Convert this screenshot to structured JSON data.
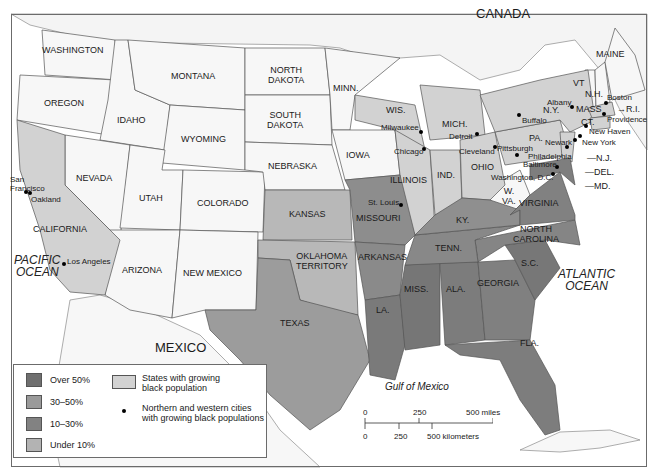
{
  "map": {
    "colors": {
      "over_50": "#6f6f6f",
      "30_50": "#9a9a9a",
      "10_30": "#828282",
      "under_10": "#b3b3b3",
      "growing_states": "#d2d2d2",
      "other_states": "#f7f7f7",
      "water": "#ffffff",
      "border": "#555555"
    },
    "regions": {
      "canada": "CANADA",
      "mexico": "MEXICO"
    },
    "oceans": {
      "pacific": [
        "PACIFIC",
        "OCEAN"
      ],
      "atlantic": [
        "ATLANTIC",
        "OCEAN"
      ],
      "gulf": "Gulf of Mexico"
    },
    "states": [
      {
        "id": "washington",
        "label": "WASHINGTON",
        "category": "none"
      },
      {
        "id": "oregon",
        "label": "OREGON",
        "category": "none"
      },
      {
        "id": "california",
        "label": "CALIFORNIA",
        "category": "growing"
      },
      {
        "id": "idaho",
        "label": "IDAHO",
        "category": "none"
      },
      {
        "id": "nevada",
        "label": "NEVADA",
        "category": "none"
      },
      {
        "id": "montana",
        "label": "MONTANA",
        "category": "none"
      },
      {
        "id": "wyoming",
        "label": "WYOMING",
        "category": "none"
      },
      {
        "id": "utah",
        "label": "UTAH",
        "category": "none"
      },
      {
        "id": "colorado",
        "label": "COLORADO",
        "category": "none"
      },
      {
        "id": "arizona",
        "label": "ARIZONA",
        "category": "none"
      },
      {
        "id": "new-mexico",
        "label": "NEW MEXICO",
        "category": "none"
      },
      {
        "id": "north-dakota",
        "label": "NORTH\nDAKOTA",
        "category": "none"
      },
      {
        "id": "south-dakota",
        "label": "SOUTH\nDAKOTA",
        "category": "none"
      },
      {
        "id": "nebraska",
        "label": "NEBRASKA",
        "category": "none"
      },
      {
        "id": "kansas",
        "label": "KANSAS",
        "category": "under_10"
      },
      {
        "id": "oklahoma",
        "label": "OKLAHOMA\nTERRITORY",
        "category": "under_10"
      },
      {
        "id": "texas",
        "label": "TEXAS",
        "category": "mixed"
      },
      {
        "id": "minnesota",
        "label": "MINN.",
        "category": "none"
      },
      {
        "id": "iowa",
        "label": "IOWA",
        "category": "none"
      },
      {
        "id": "missouri",
        "label": "MISSOURI",
        "category": "mixed"
      },
      {
        "id": "arkansas",
        "label": "ARKANSAS",
        "category": "mixed"
      },
      {
        "id": "louisiana",
        "label": "LA.",
        "category": "mixed"
      },
      {
        "id": "wisconsin",
        "label": "WIS.",
        "category": "growing"
      },
      {
        "id": "illinois",
        "label": "ILLINOIS",
        "category": "growing"
      },
      {
        "id": "michigan",
        "label": "MICH.",
        "category": "growing"
      },
      {
        "id": "indiana",
        "label": "IND.",
        "category": "growing"
      },
      {
        "id": "ohio",
        "label": "OHIO",
        "category": "growing"
      },
      {
        "id": "kentucky",
        "label": "KY.",
        "category": "mixed"
      },
      {
        "id": "tennessee",
        "label": "TENN.",
        "category": "mixed"
      },
      {
        "id": "mississippi",
        "label": "MISS.",
        "category": "mixed"
      },
      {
        "id": "alabama",
        "label": "ALA.",
        "category": "mixed"
      },
      {
        "id": "georgia",
        "label": "GEORGIA",
        "category": "mixed"
      },
      {
        "id": "florida",
        "label": "FLA.",
        "category": "mixed"
      },
      {
        "id": "south-carolina",
        "label": "S.C.",
        "category": "mixed"
      },
      {
        "id": "north-carolina",
        "label": "NORTH\nCAROLINA",
        "category": "mixed"
      },
      {
        "id": "virginia",
        "label": "VIRGINIA",
        "category": "mixed"
      },
      {
        "id": "west-virginia",
        "label": "W.\nVA.",
        "category": "none"
      },
      {
        "id": "pennsylvania",
        "label": "PA.",
        "category": "growing"
      },
      {
        "id": "new-york",
        "label": "N.Y.",
        "category": "growing"
      },
      {
        "id": "new-jersey",
        "label": "N.J.",
        "category": "growing"
      },
      {
        "id": "delaware",
        "label": "DEL.",
        "category": "mixed"
      },
      {
        "id": "maryland",
        "label": "MD.",
        "category": "mixed"
      },
      {
        "id": "vermont",
        "label": "VT",
        "category": "none"
      },
      {
        "id": "new-hampshire",
        "label": "N.H.",
        "category": "none"
      },
      {
        "id": "maine",
        "label": "MAINE",
        "category": "none"
      },
      {
        "id": "massachusetts",
        "label": "MASS",
        "category": "growing"
      },
      {
        "id": "connecticut",
        "label": "CT.",
        "category": "growing"
      },
      {
        "id": "rhode-island",
        "label": "R.I.",
        "category": "growing"
      }
    ],
    "cities": [
      {
        "name": "San Francisco",
        "label": "San\nFrancisco"
      },
      {
        "name": "Oakland",
        "label": "Oakland"
      },
      {
        "name": "Los Angeles",
        "label": "Los Angeles"
      },
      {
        "name": "St. Louis",
        "label": "St. Louis"
      },
      {
        "name": "Milwaukee",
        "label": "Milwaukee"
      },
      {
        "name": "Chicago",
        "label": "Chicago"
      },
      {
        "name": "Detroit",
        "label": "Detroit"
      },
      {
        "name": "Cleveland",
        "label": "Cleveland"
      },
      {
        "name": "Pittsburgh",
        "label": "Pittsburgh"
      },
      {
        "name": "Buffalo",
        "label": "Buffalo"
      },
      {
        "name": "Albany",
        "label": "Albany"
      },
      {
        "name": "Boston",
        "label": "Boston"
      },
      {
        "name": "Providence",
        "label": "Providence"
      },
      {
        "name": "New Haven",
        "label": "New Haven"
      },
      {
        "name": "New York",
        "label": "New York"
      },
      {
        "name": "Newark",
        "label": "Newark"
      },
      {
        "name": "Philadelphia",
        "label": "Philadelphia"
      },
      {
        "name": "Baltimore",
        "label": "Baltimore"
      },
      {
        "name": "Washington, D.C.",
        "label": "Washington, D.C."
      }
    ]
  },
  "legend": {
    "items": [
      {
        "label": "Over 50%",
        "color": "#6f6f6f"
      },
      {
        "label": "30–50%",
        "color": "#9a9a9a"
      },
      {
        "label": "10–30%",
        "color": "#828282"
      },
      {
        "label": "Under 10%",
        "color": "#b3b3b3"
      }
    ],
    "growing_states": "States with growing\nblack population",
    "growing_states_line1": "States with growing",
    "growing_states_line2": "black population",
    "cities_line1": "Northern and western cities",
    "cities_line2": "with growing black populations"
  },
  "scale": {
    "miles": [
      "0",
      "250",
      "500 miles"
    ],
    "km": [
      "0",
      "250",
      "500 kilometers"
    ]
  }
}
